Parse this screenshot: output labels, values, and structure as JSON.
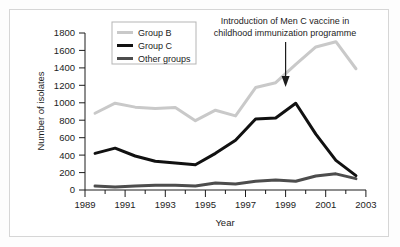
{
  "chart_data": {
    "type": "line",
    "title": "",
    "xlabel": "Year",
    "ylabel": "Number of isolates",
    "xlim": [
      1989,
      2003
    ],
    "ylim": [
      0,
      1800
    ],
    "ytick_step": 200,
    "xtick_step": 2,
    "minor_xticks": true,
    "grid": false,
    "legend_position": "top-left",
    "xticks": [
      "1989",
      "1991",
      "1993",
      "1995",
      "1997",
      "1999",
      "2001",
      "2003"
    ],
    "yticks": [
      "0",
      "200",
      "400",
      "600",
      "800",
      "1000",
      "1200",
      "1400",
      "1600",
      "1800"
    ],
    "x": [
      1989.5,
      1990.5,
      1991.5,
      1992.5,
      1993.5,
      1994.5,
      1995.5,
      1996.5,
      1997.5,
      1998.5,
      1999.5,
      2000.5,
      2001.5,
      2002.5
    ],
    "series": [
      {
        "name": "Group B",
        "color": "#c9c9c9",
        "width": 3,
        "values": [
          880,
          995,
          950,
          935,
          945,
          795,
          915,
          850,
          1175,
          1230,
          1440,
          1640,
          1700,
          1390
        ]
      },
      {
        "name": "Group C",
        "color": "#111111",
        "width": 3,
        "values": [
          420,
          480,
          390,
          330,
          310,
          290,
          420,
          570,
          815,
          825,
          995,
          640,
          340,
          165
        ]
      },
      {
        "name": "Other groups",
        "color": "#4d4d4d",
        "width": 3,
        "values": [
          45,
          35,
          45,
          55,
          55,
          45,
          80,
          70,
          100,
          115,
          100,
          160,
          185,
          130
        ]
      }
    ],
    "annotations": [
      {
        "name": "vaccine-introduction",
        "line1": "Introduction of Men C vaccine in",
        "line2": "childhood immunization programme",
        "arrow_x": 1999.5,
        "arrow_to_y": 1270
      }
    ]
  }
}
